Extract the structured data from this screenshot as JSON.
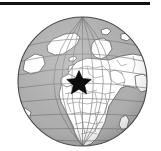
{
  "figure": {
    "kind": "orthographic-globe-locator-map",
    "width": 161,
    "height": 151,
    "background_color": "#ffffff"
  },
  "top_rule": {
    "name": "horizontal-rule",
    "color": "#111111",
    "x": 0,
    "y": 2,
    "width": 150,
    "height": 3
  },
  "globe": {
    "projection": "orthographic",
    "center_lon": 15,
    "center_lat": 25,
    "center_x": 65.5,
    "center_y": 65.5,
    "radius": 65,
    "ocean_color": "#a8a8a8",
    "land_color": "#ffffff",
    "outline_color": "#4a4a4a",
    "border_color": "#6e6e6e",
    "graticule_color": "#6b6b6b",
    "graticule_spacing_deg": 15,
    "shading": "limb-darkening"
  },
  "marker": {
    "name": "location-star",
    "shape": "star",
    "points": 5,
    "color": "#0d0d0d",
    "x": 62,
    "y": 64,
    "size": 15
  },
  "regions_depicted": [
    "Europe",
    "Africa",
    "Greenland",
    "Western Asia",
    "Arctic Ocean",
    "Atlantic Ocean",
    "Indian Ocean"
  ]
}
